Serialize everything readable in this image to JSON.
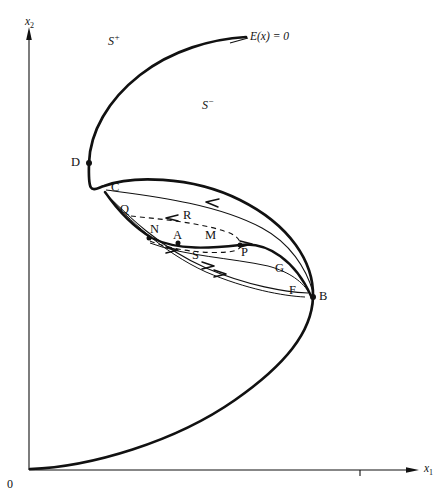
{
  "figure": {
    "kind": "phase-plane-diagram",
    "width": 448,
    "height": 501,
    "background": "#ffffff",
    "ink": "#111111"
  },
  "axes": {
    "origin_label": "0",
    "origin_px": [
      29,
      470
    ],
    "x_axis": {
      "label_main": "x",
      "label_sub": "1",
      "from_px": [
        29,
        470
      ],
      "to_px": [
        415,
        470
      ],
      "arrow": "right",
      "tick_px": [
        360,
        470
      ]
    },
    "y_axis": {
      "label_main": "x",
      "label_sub": "2",
      "from_px": [
        29,
        470
      ],
      "to_px": [
        29,
        32
      ],
      "arrow": "up"
    }
  },
  "regions": [
    {
      "name": "s-plus",
      "text_main": "S",
      "text_sup": "+",
      "px": [
        111,
        41
      ]
    },
    {
      "name": "s-minus",
      "text_main": "S",
      "text_sup": "−",
      "px": [
        205,
        105
      ]
    }
  ],
  "curves": {
    "nullcline": {
      "label": "E(x) = 0",
      "label_px": [
        251,
        38
      ],
      "leader_from_px": [
        231,
        44
      ],
      "leader_to_px": [
        248,
        38
      ],
      "stroke_width": 2.6,
      "description": "S-shaped heavy curve from origin, right fold at B, left fold at D, rising to upper right terminus"
    }
  },
  "points": [
    {
      "name": "D",
      "label": "D",
      "dot": true,
      "dot_px": [
        89,
        163
      ],
      "label_px": [
        74,
        159
      ]
    },
    {
      "name": "C",
      "label": "C",
      "dot": false,
      "dot_px": [
        107,
        189
      ],
      "label_px": [
        113,
        184
      ]
    },
    {
      "name": "Q",
      "label": "Q",
      "dot": false,
      "dot_px": [
        126,
        215
      ],
      "label_px": [
        122,
        207
      ]
    },
    {
      "name": "R",
      "label": "R",
      "dot": false,
      "dot_px": [
        190,
        216
      ],
      "label_px": [
        185,
        212
      ]
    },
    {
      "name": "N",
      "label": "N",
      "dot": true,
      "dot_px": [
        149,
        238
      ],
      "label_px": [
        152,
        226
      ]
    },
    {
      "name": "A",
      "label": "A",
      "dot": true,
      "dot_px": [
        178,
        243
      ],
      "label_px": [
        175,
        232
      ]
    },
    {
      "name": "M",
      "label": "M",
      "dot": false,
      "dot_px": [
        213,
        240
      ],
      "label_px": [
        207,
        232
      ]
    },
    {
      "name": "P",
      "label": "P",
      "dot": true,
      "dot_px": [
        240,
        246
      ],
      "label_px": [
        242,
        249
      ]
    },
    {
      "name": "S",
      "label": "S",
      "dot": false,
      "dot_px": [
        198,
        250
      ],
      "label_px": [
        194,
        252
      ]
    },
    {
      "name": "G",
      "label": "G",
      "dot": false,
      "dot_px": [
        273,
        266
      ],
      "label_px": [
        277,
        265
      ]
    },
    {
      "name": "F",
      "label": "F",
      "dot": false,
      "dot_px": [
        298,
        287
      ],
      "label_px": [
        291,
        287
      ]
    },
    {
      "name": "B",
      "label": "B",
      "dot": true,
      "dot_px": [
        313,
        297
      ],
      "label_px": [
        320,
        294
      ]
    }
  ],
  "flow_arrows": [
    {
      "name": "upper-loop-arrow",
      "direction": "left",
      "px": [
        213,
        203
      ]
    },
    {
      "name": "upper-dashed-arrow",
      "direction": "left",
      "px": [
        172,
        218
      ]
    },
    {
      "name": "middle-solid-arrow",
      "direction": "right",
      "px": [
        248,
        244
      ]
    },
    {
      "name": "lower-dashed-arrow",
      "direction": "right",
      "px": [
        172,
        250
      ]
    },
    {
      "name": "lower-loop-arrow-1",
      "direction": "right",
      "px": [
        208,
        268
      ]
    },
    {
      "name": "lower-loop-arrow-2",
      "direction": "right",
      "px": [
        219,
        275
      ]
    }
  ]
}
